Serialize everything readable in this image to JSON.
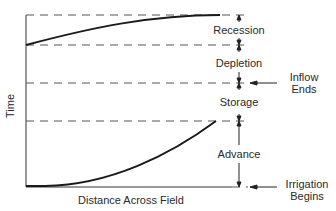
{
  "diagram": {
    "y_axis_label": "Time",
    "x_axis_label": "Distance Across Field",
    "phases": [
      {
        "name": "Recession"
      },
      {
        "name": "Depletion"
      },
      {
        "name": "Storage"
      },
      {
        "name": "Advance"
      }
    ],
    "events": {
      "inflow_ends": [
        "Inflow",
        "Ends"
      ],
      "irrigation_begins": [
        "Irrigation",
        "Begins"
      ]
    },
    "colors": {
      "line": "#1a1a1a",
      "dash": "#555555",
      "text": "#2a2a2a"
    }
  }
}
